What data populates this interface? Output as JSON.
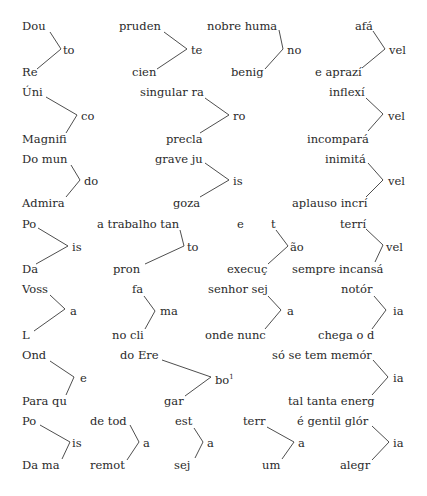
{
  "colors": {
    "text": "#2a2a2a",
    "line": "#3a3a3a",
    "background": "#ffffff"
  },
  "groups": [
    {
      "top": "Dou",
      "joint": "to",
      "bottom": "Re",
      "pos": {
        "top": [
          22,
          20
        ],
        "joint": [
          63,
          44
        ],
        "bottom": [
          22,
          66
        ]
      },
      "line": [
        [
          50,
          32
        ],
        [
          61,
          49
        ],
        [
          37,
          69
        ]
      ]
    },
    {
      "top": "pruden",
      "joint": "te",
      "bottom": "cien",
      "pos": {
        "top": [
          119,
          20
        ],
        "joint": [
          191,
          44
        ],
        "bottom": [
          132,
          66
        ]
      },
      "line": [
        [
          164,
          32
        ],
        [
          187,
          49
        ],
        [
          157,
          69
        ]
      ]
    },
    {
      "top": "nobre huma",
      "joint": "no",
      "bottom": "benig",
      "pos": {
        "top": [
          207,
          20
        ],
        "joint": [
          287,
          44
        ],
        "bottom": [
          231,
          66
        ]
      },
      "line": [
        [
          279,
          30
        ],
        [
          283,
          49
        ],
        [
          265,
          69
        ]
      ]
    },
    {
      "top": "afá",
      "joint": "vel",
      "bottom": "e aprazí",
      "pos": {
        "top": [
          355,
          20
        ],
        "joint": [
          389,
          44
        ],
        "bottom": [
          315,
          66
        ]
      },
      "line": [
        [
          373,
          31
        ],
        [
          385,
          49
        ],
        [
          362,
          68
        ]
      ]
    },
    {
      "top": "Úni",
      "joint": "co",
      "bottom": "Magnifi",
      "pos": {
        "top": [
          22,
          86
        ],
        "joint": [
          81,
          110
        ],
        "bottom": [
          22,
          133
        ]
      },
      "line": [
        [
          46,
          97
        ],
        [
          77,
          115
        ],
        [
          66,
          133
        ]
      ]
    },
    {
      "top": "singular ra",
      "joint": "ro",
      "bottom": "precla",
      "pos": {
        "top": [
          140,
          86
        ],
        "joint": [
          233,
          110
        ],
        "bottom": [
          166,
          133
        ]
      },
      "line": [
        [
          205,
          98
        ],
        [
          229,
          115
        ],
        [
          200,
          133
        ]
      ]
    },
    {
      "top": "inflexí",
      "joint": "vel",
      "bottom": "incompará",
      "pos": {
        "top": [
          329,
          86
        ],
        "joint": [
          388,
          110
        ],
        "bottom": [
          307,
          133
        ]
      },
      "line": [
        [
          366,
          98
        ],
        [
          383,
          114
        ],
        [
          368,
          131
        ]
      ]
    },
    {
      "top": "Do mun",
      "joint": "do",
      "bottom": "Admira",
      "pos": {
        "top": [
          22,
          153
        ],
        "joint": [
          84,
          175
        ],
        "bottom": [
          22,
          197
        ]
      },
      "line": [
        [
          71,
          165
        ],
        [
          80,
          180
        ],
        [
          66,
          197
        ]
      ]
    },
    {
      "top": "grave ju",
      "joint": "is",
      "bottom": "goza",
      "pos": {
        "top": [
          155,
          153
        ],
        "joint": [
          233,
          175
        ],
        "bottom": [
          173,
          197
        ]
      },
      "line": [
        [
          205,
          163
        ],
        [
          229,
          180
        ],
        [
          200,
          197
        ]
      ]
    },
    {
      "top": "inimitá",
      "joint": "vel",
      "bottom": "aplauso incrí",
      "pos": {
        "top": [
          325,
          153
        ],
        "joint": [
          388,
          175
        ],
        "bottom": [
          292,
          197
        ]
      },
      "line": [
        [
          368,
          163
        ],
        [
          383,
          180
        ],
        [
          366,
          197
        ]
      ]
    },
    {
      "top": "Po",
      "joint": "is",
      "bottom": "Da",
      "pos": {
        "top": [
          22,
          218
        ],
        "joint": [
          72,
          241
        ],
        "bottom": [
          22,
          263
        ]
      },
      "line": [
        [
          38,
          228
        ],
        [
          68,
          246
        ],
        [
          36,
          264
        ]
      ]
    },
    {
      "top": "a trabalho tan",
      "joint": "to",
      "bottom": "pron",
      "pos": {
        "top": [
          97,
          218
        ],
        "joint": [
          187,
          241
        ],
        "bottom": [
          113,
          263
        ]
      },
      "line": [
        [
          180,
          230
        ],
        [
          184,
          246
        ],
        [
          145,
          264
        ]
      ]
    },
    {
      "top": "t",
      "joint": "ão",
      "bottom": "execuç",
      "pos": {
        "top": [
          271,
          218
        ],
        "joint": [
          290,
          241
        ],
        "bottom": [
          227,
          263
        ]
      },
      "line": [
        [
          276,
          230
        ],
        [
          288,
          246
        ],
        [
          268,
          264
        ]
      ]
    },
    {
      "top": "terrí",
      "joint": "vel",
      "bottom": "sempre incansá",
      "pos": {
        "top": [
          340,
          218
        ],
        "joint": [
          386,
          241
        ],
        "bottom": [
          292,
          263
        ]
      },
      "line": [
        [
          366,
          229
        ],
        [
          383,
          245
        ],
        [
          375,
          262
        ]
      ]
    },
    {
      "top": "Voss",
      "joint": "a",
      "bottom": "L",
      "pos": {
        "top": [
          22,
          283
        ],
        "joint": [
          70,
          305
        ],
        "bottom": [
          22,
          329
        ]
      },
      "line": [
        [
          50,
          295
        ],
        [
          65,
          309
        ],
        [
          34,
          331
        ]
      ]
    },
    {
      "top": "fa",
      "joint": "ma",
      "bottom": "no cli",
      "pos": {
        "top": [
          132,
          283
        ],
        "joint": [
          160,
          305
        ],
        "bottom": [
          112,
          329
        ]
      },
      "line": [
        [
          144,
          296
        ],
        [
          155,
          311
        ],
        [
          145,
          329
        ]
      ]
    },
    {
      "top": "senhor sej",
      "joint": "a",
      "bottom": "onde nunc",
      "pos": {
        "top": [
          208,
          283
        ],
        "joint": [
          287,
          305
        ],
        "bottom": [
          205,
          329
        ]
      },
      "line": [
        [
          268,
          296
        ],
        [
          281,
          310
        ],
        [
          265,
          329
        ]
      ]
    },
    {
      "top": "notór",
      "joint": "ia",
      "bottom": "chega o d",
      "pos": {
        "top": [
          341,
          283
        ],
        "joint": [
          393,
          305
        ],
        "bottom": [
          318,
          329
        ]
      },
      "line": [
        [
          374,
          296
        ],
        [
          386,
          310
        ],
        [
          372,
          329
        ]
      ]
    },
    {
      "top": "Ond",
      "joint": "e",
      "bottom": "Para qu",
      "pos": {
        "top": [
          22,
          349
        ],
        "joint": [
          80,
          372
        ],
        "bottom": [
          22,
          395
        ]
      },
      "line": [
        [
          50,
          361
        ],
        [
          74,
          377
        ],
        [
          66,
          395
        ]
      ]
    },
    {
      "top": "do Ere",
      "joint": "bo",
      "joint_sup": "1",
      "bottom": "gar",
      "pos": {
        "top": [
          120,
          349
        ],
        "joint": [
          215,
          371
        ],
        "bottom": [
          164,
          395
        ]
      },
      "line": [
        [
          162,
          360
        ],
        [
          211,
          377
        ],
        [
          185,
          396
        ]
      ]
    },
    {
      "top": "só se tem memór",
      "joint": "ia",
      "bottom": "tal tanta energ",
      "pos": {
        "top": [
          272,
          349
        ],
        "joint": [
          393,
          372
        ],
        "bottom": [
          288,
          395
        ]
      },
      "line": [
        [
          373,
          360
        ],
        [
          388,
          377
        ],
        [
          372,
          395
        ]
      ]
    },
    {
      "top": "Po",
      "joint": "is",
      "bottom": "Da ma",
      "pos": {
        "top": [
          22,
          415
        ],
        "joint": [
          72,
          437
        ],
        "bottom": [
          22,
          459
        ]
      },
      "line": [
        [
          40,
          425
        ],
        [
          70,
          442
        ],
        [
          62,
          459
        ]
      ]
    },
    {
      "top": "de tod",
      "joint": "a",
      "bottom": "remot",
      "pos": {
        "top": [
          90,
          415
        ],
        "joint": [
          143,
          437
        ],
        "bottom": [
          90,
          459
        ]
      },
      "line": [
        [
          130,
          425
        ],
        [
          139,
          442
        ],
        [
          127,
          460
        ]
      ]
    },
    {
      "top": "est",
      "joint": "a",
      "bottom": "sej",
      "pos": {
        "top": [
          175,
          415
        ],
        "joint": [
          207,
          437
        ],
        "bottom": [
          174,
          459
        ]
      },
      "line": [
        [
          194,
          428
        ],
        [
          203,
          442
        ],
        [
          195,
          458
        ]
      ]
    },
    {
      "top": "terr",
      "joint": "a",
      "bottom": "um",
      "pos": {
        "top": [
          243,
          415
        ],
        "joint": [
          298,
          437
        ],
        "bottom": [
          262,
          459
        ]
      },
      "line": [
        [
          267,
          427
        ],
        [
          294,
          442
        ],
        [
          282,
          459
        ]
      ]
    },
    {
      "top": "é gentil glór",
      "joint": "ia",
      "bottom": "alegr",
      "pos": {
        "top": [
          297,
          415
        ],
        "joint": [
          393,
          437
        ],
        "bottom": [
          340,
          459
        ]
      },
      "line": [
        [
          372,
          426
        ],
        [
          389,
          442
        ],
        [
          372,
          460
        ]
      ]
    }
  ],
  "loose": [
    {
      "text": "e",
      "pos": [
        237,
        218
      ]
    }
  ]
}
